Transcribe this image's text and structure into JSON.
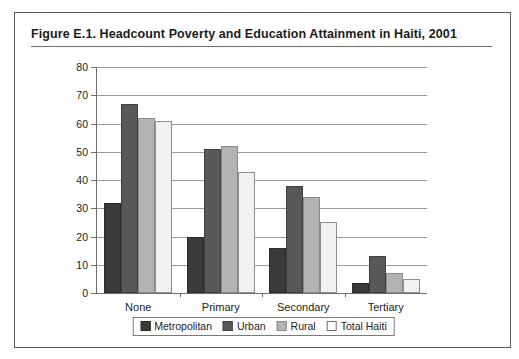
{
  "figure": {
    "title": "Figure E.1.  Headcount Poverty and Education Attainment in Haiti, 2001"
  },
  "chart_data": {
    "type": "bar",
    "title": "Figure E.1.  Headcount Poverty and Education Attainment in Haiti, 2001",
    "xlabel": "",
    "ylabel": "",
    "categories": [
      "None",
      "Primary",
      "Secondary",
      "Tertiary"
    ],
    "series": [
      {
        "name": "Metropolitan",
        "color": "#3a3a3a",
        "values": [
          32,
          20,
          16,
          3.5
        ]
      },
      {
        "name": "Urban",
        "color": "#585858",
        "values": [
          67,
          51,
          38,
          13
        ]
      },
      {
        "name": "Rural",
        "color": "#b3b3b3",
        "values": [
          62,
          52,
          34,
          7
        ]
      },
      {
        "name": "Total Haiti",
        "color": "#f1f1f1",
        "values": [
          61,
          43,
          25,
          5
        ]
      }
    ],
    "ylim": [
      0,
      80
    ],
    "yticks": [
      0,
      10,
      20,
      30,
      40,
      50,
      60,
      70,
      80
    ],
    "ytick_labels": [
      "0",
      "10",
      "20",
      "30",
      "40",
      "50",
      "60",
      "70",
      "80"
    ],
    "grid": true,
    "legend_position": "bottom"
  }
}
